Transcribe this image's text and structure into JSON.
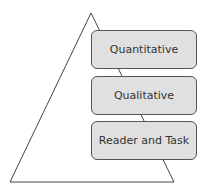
{
  "diagram": {
    "type": "pyramid",
    "shape": "triangle",
    "levels": [
      {
        "label": "Quantitative"
      },
      {
        "label": "Qualitative"
      },
      {
        "label": "Reader and Task"
      }
    ],
    "colors": {
      "box_fill": "#e0e0e0",
      "box_border": "#555555",
      "triangle_stroke": "#444444",
      "text": "#333333"
    }
  }
}
